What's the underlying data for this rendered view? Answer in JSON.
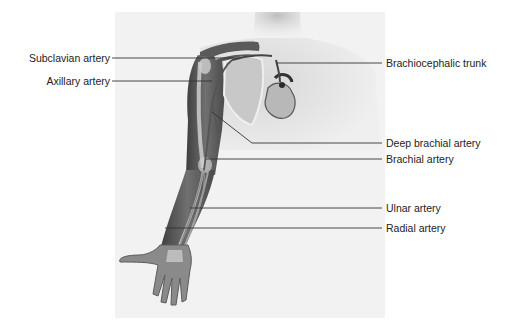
{
  "figure": {
    "colors": {
      "background": "#ffffff",
      "panel": "#f1f1f1",
      "skin_shadow": "#9a9a9a",
      "arm_dark": "#4a4a4a",
      "arm_mid": "#6e6e6e",
      "bone": "#d8d8d8",
      "leader_line": "#333333",
      "label_text": "#222222"
    },
    "labels_left": [
      {
        "id": "subclavian",
        "text": "Subclavian artery",
        "y": 58
      },
      {
        "id": "axillary",
        "text": "Axillary artery",
        "y": 81
      }
    ],
    "labels_right": [
      {
        "id": "brachiocephalic",
        "text": "Brachiocephalic trunk",
        "y": 63
      },
      {
        "id": "deep-brachial",
        "text": "Deep brachial artery",
        "y": 143
      },
      {
        "id": "brachial",
        "text": "Brachial artery",
        "y": 159
      },
      {
        "id": "ulnar",
        "text": "Ulnar artery",
        "y": 208
      },
      {
        "id": "radial",
        "text": "Radial artery",
        "y": 228
      }
    ]
  }
}
